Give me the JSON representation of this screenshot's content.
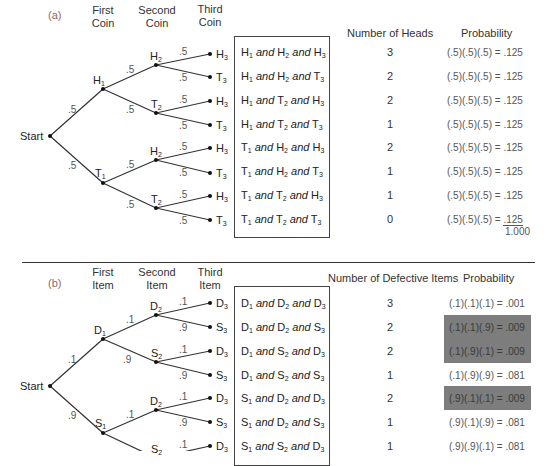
{
  "part_a": {
    "label": "(a)",
    "headers": {
      "stage1": [
        "First",
        "Coin"
      ],
      "stage2": [
        "Second",
        "Coin"
      ],
      "stage3": [
        "Third",
        "Coin"
      ],
      "count": "Number of Heads",
      "probability": "Probability"
    },
    "start_label": "Start",
    "first_branch_prob": ".5",
    "level1": [
      {
        "label": "H",
        "sub": "1",
        "prob": ".5"
      },
      {
        "label": "T",
        "sub": "1",
        "prob": ".5"
      }
    ],
    "level2_labels": [
      {
        "label": "H",
        "sub": "2",
        "prob": ".5"
      },
      {
        "label": "T",
        "sub": "2",
        "prob": ".5"
      },
      {
        "label": "H",
        "sub": "2",
        "prob": ".5"
      },
      {
        "label": "T",
        "sub": "2",
        "prob": ".5"
      }
    ],
    "leaves": [
      {
        "label": "H",
        "sub": "3",
        "prob": ".5"
      },
      {
        "label": "T",
        "sub": "3",
        "prob": ".5"
      },
      {
        "label": "H",
        "sub": "3",
        "prob": ".5"
      },
      {
        "label": "T",
        "sub": "3",
        "prob": ".5"
      },
      {
        "label": "H",
        "sub": "3",
        "prob": ".5"
      },
      {
        "label": "T",
        "sub": "3",
        "prob": ".5"
      },
      {
        "label": "H",
        "sub": "3",
        "prob": ".5"
      },
      {
        "label": "T",
        "sub": "3",
        "prob": ".5"
      }
    ],
    "rows": [
      {
        "outcome": [
          "H",
          "1",
          "H",
          "2",
          "H",
          "3"
        ],
        "count": "3",
        "calc": "(.5)(.5)(.5)",
        "value": ".125"
      },
      {
        "outcome": [
          "H",
          "1",
          "H",
          "2",
          "T",
          "3"
        ],
        "count": "2",
        "calc": "(.5)(.5)(.5)",
        "value": ".125"
      },
      {
        "outcome": [
          "H",
          "1",
          "T",
          "2",
          "H",
          "3"
        ],
        "count": "2",
        "calc": "(.5)(.5)(.5)",
        "value": ".125"
      },
      {
        "outcome": [
          "H",
          "1",
          "T",
          "2",
          "T",
          "3"
        ],
        "count": "1",
        "calc": "(.5)(.5)(.5)",
        "value": ".125"
      },
      {
        "outcome": [
          "T",
          "1",
          "H",
          "2",
          "H",
          "3"
        ],
        "count": "2",
        "calc": "(.5)(.5)(.5)",
        "value": ".125"
      },
      {
        "outcome": [
          "T",
          "1",
          "H",
          "2",
          "T",
          "3"
        ],
        "count": "1",
        "calc": "(.5)(.5)(.5)",
        "value": ".125"
      },
      {
        "outcome": [
          "T",
          "1",
          "T",
          "2",
          "H",
          "3"
        ],
        "count": "1",
        "calc": "(.5)(.5)(.5)",
        "value": ".125"
      },
      {
        "outcome": [
          "T",
          "1",
          "T",
          "2",
          "T",
          "3"
        ],
        "count": "0",
        "calc": "(.5)(.5)(.5)",
        "value": ".125"
      }
    ],
    "total": "1.000",
    "connector": "and",
    "equals": "="
  },
  "part_b": {
    "label": "(b)",
    "headers": {
      "stage1": [
        "First",
        "Item"
      ],
      "stage2": [
        "Second",
        "Item"
      ],
      "stage3": [
        "Third",
        "Item"
      ],
      "count": "Number of Defective Items",
      "probability": "Probability"
    },
    "start_label": "Start",
    "level1": [
      {
        "label": "D",
        "sub": "1",
        "prob": ".1"
      },
      {
        "label": "S",
        "sub": "1",
        "prob": ".9"
      }
    ],
    "level2_labels": [
      {
        "label": "D",
        "sub": "2",
        "prob": ".1"
      },
      {
        "label": "S",
        "sub": "2",
        "prob": ".9"
      },
      {
        "label": "D",
        "sub": "2",
        "prob": ".1"
      },
      {
        "label": "S",
        "sub": "2",
        "prob": ".9"
      }
    ],
    "leaves": [
      {
        "label": "D",
        "sub": "3",
        "prob": ".1"
      },
      {
        "label": "S",
        "sub": "3",
        "prob": ".9"
      },
      {
        "label": "D",
        "sub": "3",
        "prob": ".1"
      },
      {
        "label": "S",
        "sub": "3",
        "prob": ".9"
      },
      {
        "label": "D",
        "sub": "3",
        "prob": ".1"
      },
      {
        "label": "S",
        "sub": "3",
        "prob": ".9"
      },
      {
        "label": "D",
        "sub": "3",
        "prob": ".1"
      }
    ],
    "rows": [
      {
        "outcome": [
          "D",
          "1",
          "D",
          "2",
          "D",
          "3"
        ],
        "count": "3",
        "calc": "(.1)(.1)(.1)",
        "value": ".001",
        "highlight": false
      },
      {
        "outcome": [
          "D",
          "1",
          "D",
          "2",
          "S",
          "3"
        ],
        "count": "2",
        "calc": "(.1)(.1)(.9)",
        "value": ".009",
        "highlight": true
      },
      {
        "outcome": [
          "D",
          "1",
          "S",
          "2",
          "D",
          "3"
        ],
        "count": "2",
        "calc": "(.1)(.9)(.1)",
        "value": ".009",
        "highlight": true
      },
      {
        "outcome": [
          "D",
          "1",
          "S",
          "2",
          "S",
          "3"
        ],
        "count": "1",
        "calc": "(.1)(.9)(.9)",
        "value": ".081",
        "highlight": false
      },
      {
        "outcome": [
          "S",
          "1",
          "D",
          "2",
          "D",
          "3"
        ],
        "count": "2",
        "calc": "(.9)(.1)(.1)",
        "value": ".009",
        "highlight": true
      },
      {
        "outcome": [
          "S",
          "1",
          "D",
          "2",
          "S",
          "3"
        ],
        "count": "1",
        "calc": "(.9)(.1)(.9)",
        "value": ".081",
        "highlight": false
      },
      {
        "outcome": [
          "S",
          "1",
          "S",
          "2",
          "D",
          "3"
        ],
        "count": "1",
        "calc": "(.9)(.9)(.1)",
        "value": ".081",
        "highlight": false
      }
    ],
    "connector": "and",
    "equals": "=",
    "highlight_color": "#7d7d7d"
  }
}
